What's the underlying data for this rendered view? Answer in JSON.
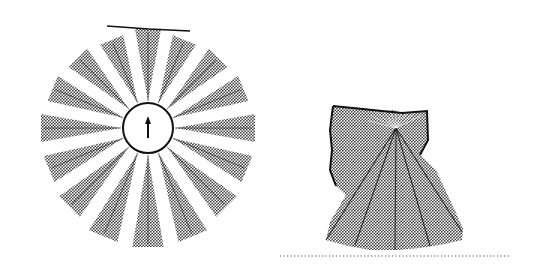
{
  "figure": {
    "left_panel": {
      "name": "sonar-ring-readings",
      "robot": {
        "cx": 148,
        "cy": 128,
        "radius": 25,
        "heading_icon": "up-arrow"
      },
      "beam_count": 16,
      "beam_half_angle_deg": 7.5,
      "beam_ranges_px": [
        100,
        96,
        100,
        104,
        108,
        108,
        112,
        118,
        120,
        118,
        112,
        108,
        108,
        104,
        100,
        96
      ],
      "top_wall_line": {
        "x1": 107,
        "y1": 26,
        "x2": 190,
        "y2": 31
      }
    },
    "right_panel": {
      "name": "accumulated-map",
      "origin": {
        "x": 396,
        "y": 128
      },
      "outline": [
        [
          333,
          106
        ],
        [
          362,
          108
        ],
        [
          382,
          111
        ],
        [
          394,
          110
        ],
        [
          402,
          113
        ],
        [
          427,
          111
        ],
        [
          428,
          140
        ],
        [
          420,
          155
        ],
        [
          436,
          170
        ],
        [
          463,
          228
        ],
        [
          462,
          240
        ],
        [
          440,
          245
        ],
        [
          420,
          248
        ],
        [
          398,
          250
        ],
        [
          370,
          250
        ],
        [
          348,
          246
        ],
        [
          326,
          240
        ],
        [
          330,
          222
        ],
        [
          346,
          195
        ],
        [
          336,
          186
        ],
        [
          330,
          170
        ],
        [
          332,
          150
        ],
        [
          330,
          130
        ]
      ],
      "wall_polyline": [
        [
          333,
          106
        ],
        [
          382,
          111
        ],
        [
          402,
          113
        ],
        [
          427,
          111
        ],
        [
          428,
          140
        ],
        [
          420,
          155
        ]
      ],
      "left_wall_polyline": [
        [
          333,
          106
        ],
        [
          330,
          130
        ],
        [
          332,
          150
        ],
        [
          330,
          170
        ],
        [
          336,
          186
        ]
      ],
      "rays_to": [
        [
          326,
          240
        ],
        [
          355,
          245
        ],
        [
          395,
          250
        ],
        [
          430,
          246
        ],
        [
          462,
          232
        ]
      ],
      "floor_line": {
        "x1": 280,
        "x2": 510,
        "y": 256
      }
    },
    "colors": {
      "fill_dark": "#555555",
      "fill_light": "#bbbbbb",
      "line": "#111111",
      "background": "#ffffff"
    }
  }
}
